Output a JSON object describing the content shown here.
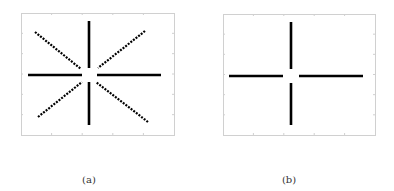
{
  "panels": [
    {
      "id": "a",
      "caption": "(a)",
      "frame": {
        "x": 21,
        "y": 13,
        "w": 153,
        "h": 122
      },
      "center": [
        89,
        75
      ],
      "strokes": [
        {
          "type": "solid",
          "x1": 89,
          "y1": 21,
          "x2": 89,
          "y2": 68
        },
        {
          "type": "solid",
          "x1": 89,
          "y1": 82,
          "x2": 89,
          "y2": 125
        },
        {
          "type": "solid",
          "x1": 28,
          "y1": 75,
          "x2": 82,
          "y2": 75
        },
        {
          "type": "solid",
          "x1": 97,
          "y1": 75,
          "x2": 161,
          "y2": 75
        },
        {
          "type": "dotted",
          "x1": 35,
          "y1": 32,
          "x2": 81,
          "y2": 69
        },
        {
          "type": "dotted",
          "x1": 145,
          "y1": 31,
          "x2": 98,
          "y2": 68
        },
        {
          "type": "dotted",
          "x1": 38,
          "y1": 117,
          "x2": 82,
          "y2": 82
        },
        {
          "type": "dotted",
          "x1": 148,
          "y1": 122,
          "x2": 96,
          "y2": 82
        }
      ]
    },
    {
      "id": "b",
      "caption": "(b)",
      "frame": {
        "x": 223,
        "y": 14,
        "w": 152,
        "h": 121
      },
      "center": [
        291,
        76
      ],
      "strokes": [
        {
          "type": "solid",
          "x1": 291,
          "y1": 22,
          "x2": 291,
          "y2": 69
        },
        {
          "type": "solid",
          "x1": 291,
          "y1": 83,
          "x2": 291,
          "y2": 125
        },
        {
          "type": "solid",
          "x1": 229,
          "y1": 76,
          "x2": 283,
          "y2": 76
        },
        {
          "type": "solid",
          "x1": 299,
          "y1": 76,
          "x2": 363,
          "y2": 76
        }
      ]
    }
  ],
  "captions": {
    "a": "(a)",
    "b": "(b)"
  }
}
